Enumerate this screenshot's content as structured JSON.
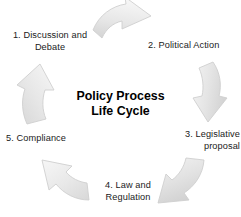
{
  "diagram": {
    "title": "Policy Process\nLife Cycle",
    "type": "cycle",
    "background_color": "#ffffff",
    "text_color": "#1a1a1a",
    "arrow_fill_light": "#f2f2f2",
    "arrow_fill_dark": "#dcdcdc",
    "arrow_stroke": "#c9c9c9",
    "steps": [
      {
        "number": "1",
        "label": "1. Discussion and\nDebate",
        "position": "top-left"
      },
      {
        "number": "2",
        "label": "2. Political Action",
        "position": "top-right"
      },
      {
        "number": "3",
        "label": "3. Legislative\nproposal",
        "position": "right"
      },
      {
        "number": "4",
        "label": "4. Law and\nRegulation",
        "position": "bottom"
      },
      {
        "number": "5",
        "label": "5. Compliance",
        "position": "left"
      }
    ],
    "arrows": [
      {
        "name": "arrow-top-right",
        "direction": "right",
        "from_step": "1",
        "to_step": "2"
      },
      {
        "name": "arrow-right-down",
        "direction": "down",
        "from_step": "2",
        "to_step": "3"
      },
      {
        "name": "arrow-bottom-right",
        "direction": "down-left",
        "from_step": "3",
        "to_step": "4"
      },
      {
        "name": "arrow-bottom-left",
        "direction": "up-left",
        "from_step": "4",
        "to_step": "5"
      },
      {
        "name": "arrow-left-up",
        "direction": "up",
        "from_step": "5",
        "to_step": "1"
      }
    ]
  }
}
